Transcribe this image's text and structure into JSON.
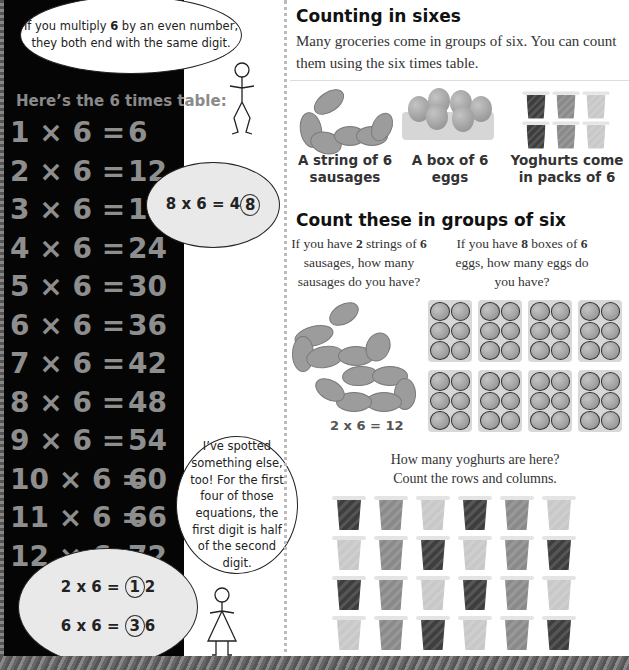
{
  "left_panel": {
    "speech_top": {
      "pre": "If you multiply ",
      "bold": "6",
      "post": " by an even number, they both end with the same digit."
    },
    "table_title": "Here’s the 6 times table:",
    "table": [
      {
        "lhs": "1 × 6 =",
        "rhs": "6"
      },
      {
        "lhs": "2 × 6 =",
        "rhs": "12"
      },
      {
        "lhs": "3 × 6 =",
        "rhs": "18"
      },
      {
        "lhs": "4 × 6 =",
        "rhs": "24"
      },
      {
        "lhs": "5 × 6 =",
        "rhs": "30"
      },
      {
        "lhs": "6 × 6 =",
        "rhs": "36"
      },
      {
        "lhs": "7 × 6 =",
        "rhs": "42"
      },
      {
        "lhs": "8 × 6 =",
        "rhs": "48"
      },
      {
        "lhs": "9 × 6 =",
        "rhs": "54"
      },
      {
        "lhs": "10 × 6 =",
        "rhs": "60"
      },
      {
        "lhs": "11 × 6 =",
        "rhs": "66"
      },
      {
        "lhs": "12 × 6 =",
        "rhs": "72"
      }
    ],
    "example_bubble": {
      "pre": "8 x 6 = 4",
      "circled": "8"
    },
    "speech_girl": "I’ve spotted something else, too! For the first four of those equations, the first digit is half of the second digit.",
    "half_examples": [
      {
        "pre": "2 x 6 = ",
        "circled": "1",
        "post": "2"
      },
      {
        "pre": "6 x 6 = ",
        "circled": "3",
        "post": "6"
      }
    ]
  },
  "right_panel": {
    "heading": "Counting in sixes",
    "intro": "Many groceries come in groups of six. You can count them using the six times table.",
    "captions": [
      "A string of 6 sausages",
      "A box of 6 eggs",
      "Yoghurts come in packs of 6"
    ],
    "section2_heading": "Count these in groups of six",
    "question_sausages": {
      "p1": "If you have ",
      "b1": "2",
      "p2": " strings of ",
      "b2": "6",
      "p3": " sausages, how many sausages do you have?"
    },
    "question_eggs": {
      "p1": "If you have ",
      "b1": "8",
      "p2": " boxes of ",
      "b2": "6",
      "p3": " eggs, how many eggs do you have?"
    },
    "sausage_answer": "2 x 6 = 12",
    "yoghurt_question_line1": "How many yoghurts are here?",
    "yoghurt_question_line2": "Count the rows and columns.",
    "yoghurt_grid": [
      [
        "#3e3e3e",
        "#8a8a8a",
        "#c8c8c8",
        "#3e3e3e",
        "#8a8a8a",
        "#c8c8c8"
      ],
      [
        "#c8c8c8",
        "#8a8a8a",
        "#3e3e3e",
        "#c8c8c8",
        "#8a8a8a",
        "#3e3e3e"
      ],
      [
        "#3e3e3e",
        "#8a8a8a",
        "#c8c8c8",
        "#3e3e3e",
        "#8a8a8a",
        "#c8c8c8"
      ],
      [
        "#c8c8c8",
        "#8a8a8a",
        "#3e3e3e",
        "#c8c8c8",
        "#8a8a8a",
        "#3e3e3e"
      ]
    ],
    "egg_cartons": {
      "rows": 2,
      "cols": 4
    }
  }
}
